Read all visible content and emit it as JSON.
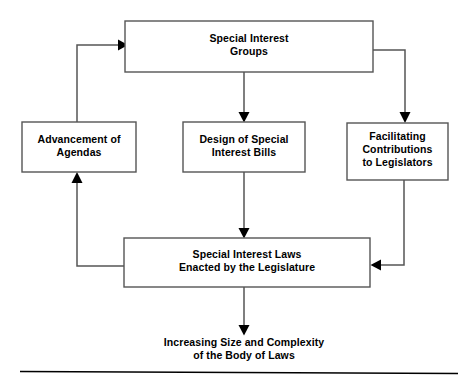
{
  "diagram": {
    "colors": {
      "box_border": "#555555",
      "connector": "#555555",
      "arrowhead": "#000000",
      "text": "#000000",
      "background": "#ffffff",
      "rule": "#000000"
    },
    "nodes": {
      "special_interest_groups": {
        "lines": [
          "Special Interest",
          "Groups"
        ],
        "line1": "Special Interest",
        "line2": "Groups"
      },
      "advancement_of_agendas": {
        "lines": [
          "Advancement of",
          "Agendas"
        ],
        "line1": "Advancement of",
        "line2": "Agendas"
      },
      "design_of_special_interest_bills": {
        "lines": [
          "Design of Special",
          "Interest Bills"
        ],
        "line1": "Design of Special",
        "line2": "Interest Bills"
      },
      "facilitating_contributions": {
        "lines": [
          "Facilitating",
          "Contributions",
          "to Legislators"
        ],
        "line1": "Facilitating",
        "line2": "Contributions",
        "line3": "to Legislators"
      },
      "special_interest_laws": {
        "lines": [
          "Special Interest Laws",
          "Enacted by the Legislature"
        ],
        "line1": "Special Interest Laws",
        "line2": "Enacted by the Legislature"
      }
    },
    "caption": {
      "line1": "Increasing Size and Complexity",
      "line2": "of the Body of Laws"
    },
    "edges": [
      {
        "name": "sig-to-design",
        "from": "special_interest_groups",
        "to": "design_of_special_interest_bills",
        "label": ""
      },
      {
        "name": "sig-to-facilitating",
        "from": "special_interest_groups",
        "to": "facilitating_contributions",
        "label": ""
      },
      {
        "name": "design-to-laws",
        "from": "design_of_special_interest_bills",
        "to": "special_interest_laws",
        "label": ""
      },
      {
        "name": "facilitating-to-laws",
        "from": "facilitating_contributions",
        "to": "special_interest_laws",
        "label": ""
      },
      {
        "name": "laws-to-advancement",
        "from": "special_interest_laws",
        "to": "advancement_of_agendas",
        "label": ""
      },
      {
        "name": "advancement-to-sig",
        "from": "advancement_of_agendas",
        "to": "special_interest_groups",
        "label": ""
      },
      {
        "name": "laws-to-caption",
        "from": "special_interest_laws",
        "to": "caption",
        "label": ""
      }
    ]
  }
}
